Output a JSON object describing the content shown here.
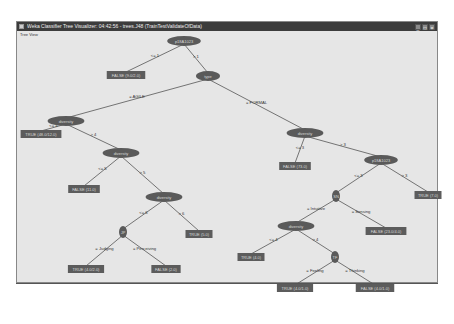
{
  "window": {
    "title": "Weka Classifier Tree Visualizer: 04:42:56 - trees.J48 (TrainTestValidateOfData)",
    "menu": "Tree View",
    "buttons": {
      "minimize": "_",
      "maximize": "□",
      "close": "×"
    }
  },
  "tree": {
    "nodes": [
      {
        "id": "n0",
        "type": "inner",
        "label": "p18A1023",
        "x": 184,
        "y": 41
      },
      {
        "id": "l1",
        "type": "leaf",
        "label": "FALSE (9.0/2.0)",
        "x": 126,
        "y": 75
      },
      {
        "id": "n1",
        "type": "inner",
        "label": "type",
        "x": 208,
        "y": 76
      },
      {
        "id": "n2",
        "type": "inner",
        "label": "diversity",
        "x": 66,
        "y": 121
      },
      {
        "id": "l2",
        "type": "leaf",
        "label": "TRUE (48.0/12.0)",
        "x": 41,
        "y": 134
      },
      {
        "id": "n3",
        "type": "inner",
        "label": "diversity",
        "x": 121,
        "y": 153
      },
      {
        "id": "l3",
        "type": "leaf",
        "label": "FALSE (11.0)",
        "x": 84,
        "y": 189
      },
      {
        "id": "n4",
        "type": "inner",
        "label": "diversity",
        "x": 164,
        "y": 197
      },
      {
        "id": "n5",
        "type": "inner",
        "label": "JP",
        "x": 123,
        "y": 232
      },
      {
        "id": "l4",
        "type": "leaf",
        "label": "TRUE (5.0)",
        "x": 199,
        "y": 234
      },
      {
        "id": "l5",
        "type": "leaf",
        "label": "TRUE (4.0/2.0)",
        "x": 86,
        "y": 269
      },
      {
        "id": "l6",
        "type": "leaf",
        "label": "FALSE (2.0)",
        "x": 166,
        "y": 269
      },
      {
        "id": "n6",
        "type": "inner",
        "label": "diversity",
        "x": 305,
        "y": 133
      },
      {
        "id": "l7",
        "type": "leaf",
        "label": "FALSE (73.0)",
        "x": 295,
        "y": 166
      },
      {
        "id": "n7",
        "type": "inner",
        "label": "p18A1023",
        "x": 381,
        "y": 160
      },
      {
        "id": "n8",
        "type": "inner",
        "label": "SN",
        "x": 336,
        "y": 196
      },
      {
        "id": "l8",
        "type": "leaf",
        "label": "TRUE (7.0)",
        "x": 428,
        "y": 195
      },
      {
        "id": "n9",
        "type": "inner",
        "label": "diversity",
        "x": 296,
        "y": 226
      },
      {
        "id": "l9",
        "type": "leaf",
        "label": "FALSE (23.0/4.0)",
        "x": 386,
        "y": 231
      },
      {
        "id": "l10",
        "type": "leaf",
        "label": "TRUE (4.0)",
        "x": 251,
        "y": 257
      },
      {
        "id": "n10",
        "type": "inner",
        "label": "TF",
        "x": 335,
        "y": 257
      },
      {
        "id": "l11",
        "type": "leaf",
        "label": "TRUE (4.0/1.0)",
        "x": 295,
        "y": 288
      },
      {
        "id": "l12",
        "type": "leaf",
        "label": "FALSE (4.0/1.0)",
        "x": 375,
        "y": 288
      }
    ],
    "edges": [
      {
        "from": "n0",
        "to": "l1",
        "label": "<= 1"
      },
      {
        "from": "n0",
        "to": "n1",
        "label": "> 1"
      },
      {
        "from": "n1",
        "to": "n2",
        "label": "= AGILE"
      },
      {
        "from": "n1",
        "to": "n6",
        "label": "= FORMAL"
      },
      {
        "from": "n2",
        "to": "l2",
        "label": "<= 4"
      },
      {
        "from": "n2",
        "to": "n3",
        "label": "> 4"
      },
      {
        "from": "n3",
        "to": "l3",
        "label": "<= 5"
      },
      {
        "from": "n3",
        "to": "n4",
        "label": "> 5"
      },
      {
        "from": "n4",
        "to": "n5",
        "label": "<= 6"
      },
      {
        "from": "n4",
        "to": "l4",
        "label": "> 6"
      },
      {
        "from": "n5",
        "to": "l5",
        "label": "= Judging"
      },
      {
        "from": "n5",
        "to": "l6",
        "label": "= Perceiving"
      },
      {
        "from": "n6",
        "to": "l7",
        "label": "<= 3"
      },
      {
        "from": "n6",
        "to": "n7",
        "label": "> 3"
      },
      {
        "from": "n7",
        "to": "n8",
        "label": "<= 3"
      },
      {
        "from": "n7",
        "to": "l8",
        "label": "> 3"
      },
      {
        "from": "n8",
        "to": "n9",
        "label": "= Intuitive"
      },
      {
        "from": "n8",
        "to": "l9",
        "label": "= Sensing"
      },
      {
        "from": "n9",
        "to": "l10",
        "label": "<= 4"
      },
      {
        "from": "n9",
        "to": "n10",
        "label": "> 4"
      },
      {
        "from": "n10",
        "to": "l11",
        "label": "= Feeling"
      },
      {
        "from": "n10",
        "to": "l12",
        "label": "= Thinking"
      }
    ]
  },
  "colors": {
    "node_fill": "#5a5a5a",
    "leaf_fill": "#5c5c5c",
    "edge": "#555555",
    "text_light": "#d8d8d8",
    "text_dark": "#333333",
    "canvas_bg": "#e6e6e6"
  }
}
